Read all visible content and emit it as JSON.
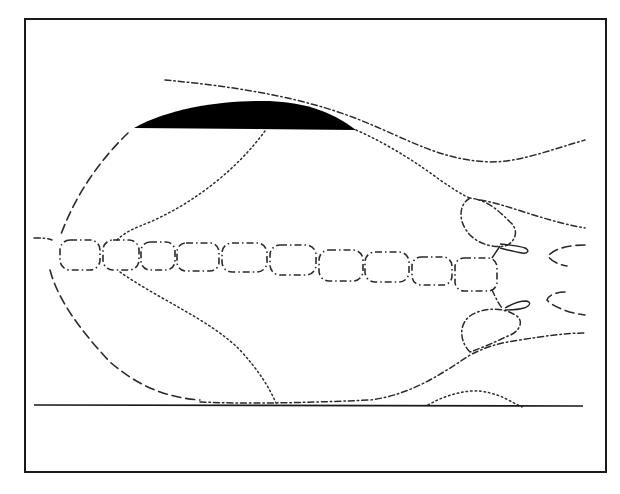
{
  "figure": {
    "type": "line-diagram",
    "style": "monochrome schematic (dashed / dotted / dash-dot outlines)",
    "frame": {
      "border_color": "#1a1a1a",
      "background": "#ffffff"
    },
    "elements": {
      "cap": {
        "label": "black crescent cap",
        "fill": "#000000"
      },
      "cell_chain": {
        "label": "horizontal chain of rounded rectangular segments",
        "segment_count": 10
      },
      "baseline": {
        "label": "horizontal baseline"
      },
      "right_lobes": {
        "label": "paired lobes with small loops on right"
      },
      "open_arcs": {
        "label": "two open C-shaped arcs at far right",
        "count": 2
      }
    },
    "caption": {
      "visible": "partially clipped",
      "text": ""
    }
  }
}
